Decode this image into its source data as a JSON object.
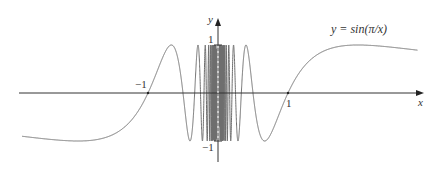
{
  "chart_data": {
    "type": "line",
    "title": "",
    "function_label": "y = sin(π/x)",
    "function": "sin(pi/x)",
    "xlabel": "x",
    "ylabel": "y",
    "xlim": [
      -2.83,
      2.9
    ],
    "ylim": [
      -1.25,
      1.7
    ],
    "x_ticks": [
      {
        "value": -1,
        "label": "−1"
      },
      {
        "value": 1,
        "label": "1"
      }
    ],
    "y_ticks": [
      {
        "value": 1,
        "label": "1"
      },
      {
        "value": -1,
        "label": "−1"
      }
    ],
    "grid": false,
    "legend": "none",
    "curve_domain": [
      -2.8,
      2.85
    ],
    "sample_points": [
      {
        "x": -2.8,
        "y": -0.9
      },
      {
        "x": -2.0,
        "y": -1.0
      },
      {
        "x": -1.0,
        "y": 0.0
      },
      {
        "x": -0.667,
        "y": 1.0
      },
      {
        "x": -0.5,
        "y": 0.0
      },
      {
        "x": -0.4,
        "y": -1.0
      },
      {
        "x": 0.4,
        "y": 1.0
      },
      {
        "x": 0.5,
        "y": 0.0
      },
      {
        "x": 0.667,
        "y": -1.0
      },
      {
        "x": 1.0,
        "y": 0.0
      },
      {
        "x": 2.0,
        "y": 1.0
      },
      {
        "x": 2.85,
        "y": 0.88
      }
    ]
  },
  "labels": {
    "function": "y = sin(π/x)",
    "x_axis": "x",
    "y_axis": "y",
    "x_tick_neg1": "−1",
    "x_tick_1": "1",
    "y_tick_1": "1",
    "y_tick_neg1": "−1"
  },
  "colors": {
    "curve": "#6e6e6e",
    "axis": "#333333"
  }
}
